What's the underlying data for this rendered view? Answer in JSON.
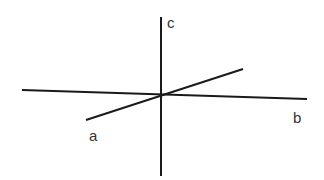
{
  "diagram": {
    "type": "3d-axes",
    "axes": [
      {
        "name": "a",
        "label": "a",
        "from": [
          86,
          120
        ],
        "to": [
          243,
          69
        ]
      },
      {
        "name": "b",
        "label": "b",
        "from": [
          22,
          90
        ],
        "to": [
          307,
          99
        ]
      },
      {
        "name": "c",
        "label": "c",
        "from": [
          161,
          17
        ],
        "to": [
          161,
          176
        ]
      }
    ],
    "line_color": "#1a1a1a",
    "label_color": "#333333"
  },
  "labels": {
    "a": "a",
    "b": "b",
    "c": "c"
  }
}
